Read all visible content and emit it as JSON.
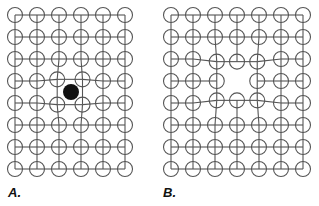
{
  "panels": [
    {
      "label": "A.",
      "description": "Lattice with interstitial impurity atom (filled) distorting neighbors",
      "cols": 6,
      "rows": 8,
      "x0": 15,
      "y0": 15,
      "spacing": 22,
      "defect": "interstitial",
      "defect_pos": [
        71,
        92
      ]
    },
    {
      "label": "B.",
      "description": "Lattice with vacancy; neighboring atoms displaced toward the gap",
      "cols": 7,
      "rows": 8,
      "x0": 171,
      "y0": 15,
      "spacing": 22,
      "defect": "vacancy",
      "defect_cell": [
        3,
        3
      ]
    }
  ],
  "colors": {
    "line": "#555555",
    "defect": "#111111"
  }
}
